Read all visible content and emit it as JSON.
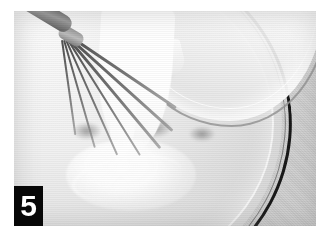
{
  "page": {
    "background_color": "#ffffff",
    "width": 334,
    "height": 247
  },
  "photo": {
    "kind": "photograph",
    "color_mode": "grayscale",
    "caption_badge": {
      "label": "5",
      "background_color": "#070707",
      "text_color": "#ffffff",
      "position": "bottom-left"
    },
    "scene": {
      "description": "Cream being poured from a glass measuring jug into a mixing bowl containing whisked batter, with a balloon whisk resting in the bowl",
      "objects": [
        {
          "name": "whisk",
          "position": "top-left",
          "tine_count": 7,
          "tone": "#5a5a5a"
        },
        {
          "name": "glass-measuring-jug",
          "position": "top-right",
          "tone": "#f2f2f2"
        },
        {
          "name": "pouring-cream-stream",
          "position": "center-left",
          "tone": "#ffffff"
        },
        {
          "name": "mixing-bowl",
          "position": "full-frame",
          "rim_tone": "#171717"
        },
        {
          "name": "batter-surface",
          "position": "bottom-center",
          "tone": "#ededed"
        },
        {
          "name": "countertop",
          "position": "right-edge",
          "tone": "#cfcfcf"
        }
      ]
    },
    "frame": {
      "left": 14,
      "top": 11,
      "width": 302,
      "height": 215
    }
  },
  "whisk_tines": [
    {
      "left": 56,
      "top": 24,
      "width": 128,
      "height": 3,
      "angle": 34
    },
    {
      "left": 56,
      "top": 26,
      "width": 138,
      "height": 3,
      "angle": 42
    },
    {
      "left": 55,
      "top": 27,
      "width": 142,
      "height": 3,
      "angle": 50
    },
    {
      "left": 54,
      "top": 28,
      "width": 136,
      "height": 2,
      "angle": 58
    },
    {
      "left": 52,
      "top": 28,
      "width": 126,
      "height": 2,
      "angle": 66
    },
    {
      "left": 50,
      "top": 28,
      "width": 112,
      "height": 2,
      "angle": 74
    },
    {
      "left": 48,
      "top": 28,
      "width": 96,
      "height": 2,
      "angle": 82
    }
  ]
}
